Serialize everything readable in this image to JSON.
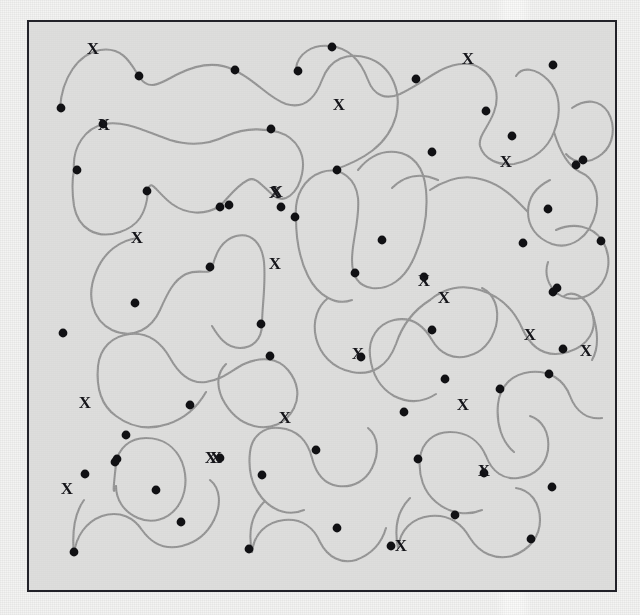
{
  "figure": {
    "background_color": "#f4f4f3",
    "panel_color": "#ececeb",
    "frame_color": "#23232a",
    "curve_color": "#9a9a9a",
    "dot_color": "#111114",
    "label_color": "#15151a",
    "scan_band_color": "#fbfbfa",
    "label_text": "X",
    "counts": {
      "curves": 21,
      "dots": 60,
      "x_labels": 22
    }
  },
  "frame": {
    "x": 27,
    "y": 20,
    "width": 590,
    "height": 572,
    "stroke_width": 2
  },
  "scan_band": {
    "x": 496,
    "width": 36,
    "opacity": 0.85
  },
  "style": {
    "curve_stroke_width": 2.1,
    "dot_radius": 4.4,
    "label_font_size": 17
  },
  "chart_data": {
    "type": "scatter",
    "xlabel": "",
    "ylabel": "",
    "xlim": [
      27,
      617
    ],
    "ylim": [
      20,
      592
    ],
    "grid": false,
    "legend": null,
    "annotations_label": "X",
    "curves": [
      "M 60,108 C 62,78 78,54 100,50 C 124,46 132,66 140,78 C 150,92 162,82 178,74 C 198,64 218,62 234,70",
      "M 234,70 C 256,80 268,98 286,104 C 306,110 316,96 322,80 C 330,58 348,52 368,58 C 392,66 402,92 396,116 C 388,146 362,160 334,170",
      "M 74,170 C 72,146 86,128 104,124 C 126,120 146,132 170,140 C 196,148 214,142 226,136 C 244,128 262,128 278,132",
      "M 278,132 C 298,138 306,156 302,174 C 298,194 284,204 274,196 C 262,186 256,176 248,180 C 236,186 228,198 220,206",
      "M 220,206 C 204,216 186,214 172,204 C 156,192 150,176 148,192 C 146,214 138,226 120,232 C 96,240 78,228 74,206 C 72,192 72,180 74,170",
      "M 138,238 C 120,240 104,252 96,272 C 86,296 92,320 112,330 C 134,340 152,328 160,310 C 168,292 174,280 186,274 C 200,268 210,276 212,268",
      "M 212,268 C 216,252 222,240 236,236 C 252,232 262,244 264,262 C 266,284 262,308 262,324",
      "M 262,324 C 262,340 252,348 240,348 C 226,348 218,336 212,326",
      "M 296,218 C 294,196 304,178 322,172 C 342,166 356,180 358,198 C 360,220 352,240 352,260 C 352,276 358,286 372,288 C 390,290 404,278 412,262",
      "M 412,262 C 424,238 428,212 426,190 C 424,166 412,154 396,152 C 378,150 366,160 358,170",
      "M 296,218 C 296,240 300,260 308,276 C 318,296 336,306 352,300",
      "M 296,68 C 298,54 312,44 330,46 C 352,48 362,64 368,80 C 374,96 386,100 400,94 C 416,86 424,80 434,74 C 450,64 468,60 480,68",
      "M 480,68 C 496,78 500,96 494,112 C 488,128 478,136 480,146 C 484,160 500,166 514,164 C 534,160 548,148 554,132",
      "M 554,132 C 562,112 560,92 548,80 C 536,68 522,66 516,76",
      "M 554,132 C 560,152 568,166 580,172 C 594,178 600,192 596,212 C 590,238 570,250 552,244 C 536,238 528,226 528,212",
      "M 528,212 C 528,196 538,186 550,180",
      "M 430,190 C 448,178 466,174 484,180 C 504,186 516,200 528,212",
      "M 438,180 C 420,172 404,176 392,188",
      "M 430,300 C 444,288 462,284 480,290 C 500,296 514,310 522,328 C 532,350 548,358 568,352 C 588,346 598,330 592,312",
      "M 592,312 C 586,296 572,290 564,296",
      "M 592,312 C 598,330 600,346 592,360",
      "M 430,300 C 414,310 402,326 396,344 C 388,366 372,376 352,372 C 332,368 320,354 316,338",
      "M 316,338 C 312,320 318,306 328,298",
      "M 98,366 C 100,348 112,336 130,334 C 150,332 162,344 170,358 C 180,376 192,384 206,382 C 222,380 232,370 244,364",
      "M 244,364 C 262,356 278,358 288,370 C 298,382 300,396 294,408",
      "M 294,408 C 286,424 270,430 254,426 C 238,422 228,410 222,398",
      "M 222,398 C 216,384 218,372 226,364",
      "M 98,366 C 96,388 102,406 116,416 C 132,428 150,430 168,424",
      "M 168,424 C 186,418 198,406 206,392",
      "M 370,356 C 368,338 378,324 394,320 C 412,316 424,326 432,340 C 440,354 454,360 468,356 C 484,352 492,340 496,326",
      "M 496,326 C 500,308 494,294 482,288",
      "M 370,356 C 372,374 380,388 394,396 C 410,404 424,402 436,394",
      "M 116,464 C 118,448 130,438 146,438 C 164,438 176,448 182,462 C 188,478 186,494 178,506",
      "M 178,506 C 168,520 152,524 138,518 C 124,512 116,500 116,486",
      "M 116,464 C 114,482 112,500 116,486",
      "M 250,452 C 252,436 264,426 280,428 C 298,430 308,442 312,458 C 316,474 324,484 338,486 C 354,488 366,480 372,468",
      "M 372,468 C 380,452 378,436 368,428",
      "M 250,452 C 248,470 252,486 262,498 C 274,512 290,516 304,510",
      "M 420,458 C 422,442 434,432 450,432 C 468,432 480,442 486,456 C 492,472 504,480 518,478 C 536,476 546,464 548,450",
      "M 548,450 C 550,432 542,420 530,416",
      "M 420,458 C 418,476 424,492 436,502 C 450,514 468,516 482,510",
      "M 74,554 C 76,536 86,522 102,516 C 120,510 134,518 142,530 C 152,544 166,550 182,546 C 198,542 208,532 214,520",
      "M 214,520 C 222,504 220,488 210,480",
      "M 74,554 C 72,534 74,514 84,500",
      "M 252,552 C 254,534 266,522 284,520 C 302,518 314,528 320,542 C 328,558 342,564 356,560",
      "M 356,560 C 372,554 382,542 386,528",
      "M 252,552 C 248,532 252,514 264,502",
      "M 398,548 C 400,530 412,518 430,516 C 450,514 462,524 470,538 C 480,554 496,560 512,556 C 530,550 540,536 540,520",
      "M 540,520 C 540,502 530,490 516,488",
      "M 398,548 C 394,528 398,510 410,498",
      "M 498,404 C 500,386 512,374 530,372 C 550,370 564,380 570,396 C 576,412 588,420 602,418",
      "M 498,404 C 496,424 502,442 514,452",
      "M 556,230 C 574,222 592,226 602,240 C 612,256 610,276 598,288 C 586,300 570,302 558,294",
      "M 558,294 C 548,286 544,274 548,262",
      "M 572,108 C 586,98 600,100 608,112 C 616,126 614,144 602,154 C 590,164 574,164 566,154"
    ],
    "dots": [
      [
        61,
        108
      ],
      [
        139,
        76
      ],
      [
        235,
        70
      ],
      [
        298,
        71
      ],
      [
        416,
        79
      ],
      [
        553,
        65
      ],
      [
        271,
        129
      ],
      [
        77,
        170
      ],
      [
        147,
        191
      ],
      [
        220,
        207
      ],
      [
        281,
        207
      ],
      [
        512,
        136
      ],
      [
        576,
        165
      ],
      [
        432,
        152
      ],
      [
        337,
        170
      ],
      [
        295,
        217
      ],
      [
        382,
        240
      ],
      [
        210,
        267
      ],
      [
        135,
        303
      ],
      [
        261,
        324
      ],
      [
        355,
        273
      ],
      [
        424,
        277
      ],
      [
        523,
        243
      ],
      [
        553,
        292
      ],
      [
        63,
        333
      ],
      [
        432,
        330
      ],
      [
        563,
        349
      ],
      [
        270,
        356
      ],
      [
        361,
        357
      ],
      [
        190,
        405
      ],
      [
        126,
        435
      ],
      [
        117,
        459
      ],
      [
        404,
        412
      ],
      [
        445,
        379
      ],
      [
        500,
        389
      ],
      [
        549,
        374
      ],
      [
        220,
        458
      ],
      [
        262,
        475
      ],
      [
        115,
        462
      ],
      [
        316,
        450
      ],
      [
        418,
        459
      ],
      [
        484,
        473
      ],
      [
        552,
        487
      ],
      [
        85,
        474
      ],
      [
        156,
        490
      ],
      [
        181,
        522
      ],
      [
        249,
        549
      ],
      [
        337,
        528
      ],
      [
        391,
        546
      ],
      [
        455,
        515
      ],
      [
        531,
        539
      ],
      [
        74,
        552
      ],
      [
        583,
        160
      ],
      [
        601,
        241
      ],
      [
        557,
        288
      ],
      [
        548,
        209
      ],
      [
        486,
        111
      ],
      [
        332,
        47
      ],
      [
        103,
        124
      ],
      [
        229,
        205
      ]
    ],
    "x_labels": [
      [
        93,
        50
      ],
      [
        104,
        126
      ],
      [
        277,
        193
      ],
      [
        137,
        239
      ],
      [
        275,
        265
      ],
      [
        339,
        106
      ],
      [
        424,
        282
      ],
      [
        468,
        60
      ],
      [
        506,
        163
      ],
      [
        586,
        352
      ],
      [
        85,
        404
      ],
      [
        216,
        459
      ],
      [
        285,
        419
      ],
      [
        463,
        406
      ],
      [
        484,
        472
      ],
      [
        67,
        490
      ],
      [
        211,
        459
      ],
      [
        401,
        547
      ],
      [
        444,
        299
      ],
      [
        358,
        355
      ],
      [
        530,
        336
      ],
      [
        275,
        194
      ]
    ]
  }
}
